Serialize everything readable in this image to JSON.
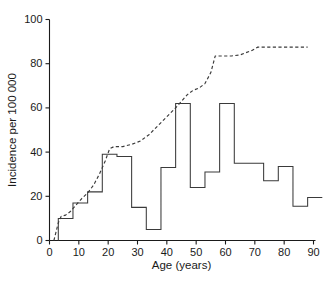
{
  "chart_data": {
    "type": "line",
    "title": "",
    "xlabel": "Age (years)",
    "ylabel": "Incidence per 100 000",
    "xlim": [
      0,
      90
    ],
    "ylim": [
      0,
      100
    ],
    "xticks": [
      0,
      10,
      20,
      30,
      40,
      50,
      60,
      70,
      80,
      90
    ],
    "yticks": [
      0,
      20,
      40,
      60,
      80,
      100
    ],
    "xticklabels": [
      "0",
      "10",
      "20",
      "30",
      "40",
      "50",
      "60",
      "70",
      "80",
      "90"
    ],
    "yticklabels": [
      "0",
      "20",
      "40",
      "60",
      "80",
      "100"
    ],
    "grid": false,
    "legend": "none",
    "series": [
      {
        "name": "age-specific-incidence",
        "style": "step",
        "linestyle": "solid",
        "color": "#3a3a3a",
        "bin_edges": [
          3,
          8,
          13,
          18,
          23,
          28,
          33,
          38,
          43,
          48,
          53,
          58,
          63,
          68,
          73,
          78,
          83,
          88
        ],
        "values": [
          10,
          17,
          22,
          39,
          38,
          15,
          5,
          33,
          62,
          24,
          31,
          62,
          35,
          35,
          27,
          33.5,
          15.5,
          19.5
        ]
      },
      {
        "name": "cumulative-incidence",
        "style": "line",
        "linestyle": "dashed",
        "color": "#3a3a3a",
        "x": [
          1.5,
          3,
          4,
          5.5,
          7,
          9,
          11,
          13,
          15,
          17,
          19,
          20.5,
          22,
          25,
          28,
          31,
          34,
          37,
          40,
          43,
          45,
          47,
          49,
          51,
          53,
          55,
          56.5,
          59,
          62,
          65,
          67,
          69,
          71,
          73,
          78,
          83,
          88
        ],
        "y": [
          0,
          8,
          11,
          11.5,
          13,
          16,
          19,
          21.5,
          25,
          30,
          36,
          41.5,
          42.5,
          42.5,
          43.5,
          45,
          48,
          52,
          56,
          60,
          63,
          66,
          68,
          69,
          71,
          76,
          83.5,
          83.5,
          83.5,
          84,
          85,
          86,
          87.5,
          87.5,
          87.5,
          87.5,
          87.5
        ]
      }
    ]
  }
}
